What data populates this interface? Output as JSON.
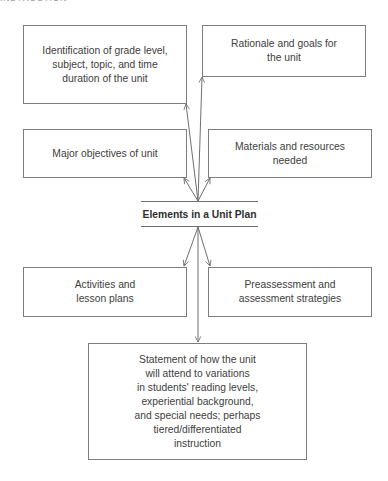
{
  "header": {
    "partial_text": "INSTRUCTION"
  },
  "diagram": {
    "title": "Elements in a Unit Plan",
    "nodes": [
      {
        "id": "identification",
        "text": "Identification of grade level,\nsubject, topic, and time\nduration of the unit"
      },
      {
        "id": "rationale",
        "text": "Rationale and goals for\nthe unit"
      },
      {
        "id": "objectives",
        "text": "Major objectives of unit"
      },
      {
        "id": "materials",
        "text": "Materials and resources\nneeded"
      },
      {
        "id": "activities",
        "text": "Activities and\nlesson plans"
      },
      {
        "id": "assessment",
        "text": "Preassessment and\nassessment strategies"
      },
      {
        "id": "variations",
        "text": "Statement of how the unit\nwill attend to variations\nin students' reading levels,\nexperiential background,\nand special needs; perhaps\ntiered/differentiated\ninstruction"
      }
    ],
    "edges": [
      {
        "from": "Elements in a Unit Plan",
        "to": "identification"
      },
      {
        "from": "Elements in a Unit Plan",
        "to": "rationale"
      },
      {
        "from": "Elements in a Unit Plan",
        "to": "objectives"
      },
      {
        "from": "Elements in a Unit Plan",
        "to": "materials"
      },
      {
        "from": "Elements in a Unit Plan",
        "to": "activities"
      },
      {
        "from": "Elements in a Unit Plan",
        "to": "assessment"
      },
      {
        "from": "Elements in a Unit Plan",
        "to": "variations"
      }
    ],
    "colors": {
      "line": "#6f6f6f",
      "text": "#404040",
      "background": "#ffffff"
    }
  }
}
